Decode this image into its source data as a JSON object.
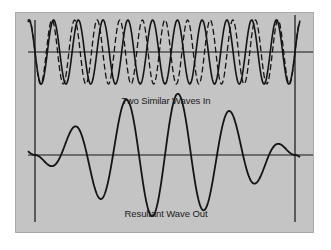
{
  "figure": {
    "top_label": "Two Similar Waves In",
    "bottom_label": "Resultant Wave Out",
    "colors": {
      "panel": "#c4c4c4",
      "ink": "#141414",
      "background": "#ffffff"
    }
  },
  "waves": {
    "input_a": {
      "style": "solid",
      "cycles": 10.5,
      "amplitude": 1.0,
      "phase": 0.0
    },
    "input_b": {
      "style": "dashed",
      "cycles": 11.5,
      "amplitude": 1.0,
      "phase": 0.0
    },
    "resultant": {
      "style": "solid",
      "description": "beat pattern: sum of input_a and input_b",
      "node_position": 0.5
    }
  }
}
